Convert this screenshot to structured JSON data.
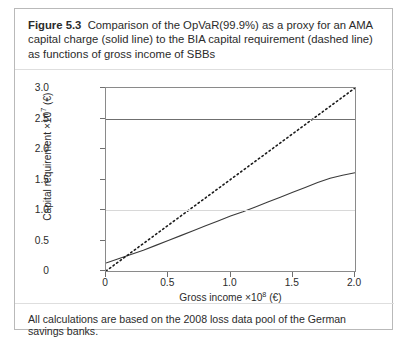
{
  "figure": {
    "caption_label": "Figure 5.3",
    "caption_text": "Comparison of the OpVaR(99.9%) as a proxy for an AMA capital charge (solid line) to the BIA capital requirement (dashed line) as functions of gross income of SBBs",
    "footnote": "All calculations are based on the 2008 loss data pool of the German savings banks."
  },
  "chart_data": {
    "type": "line",
    "title": "",
    "xlabel": "Gross income ×10⁸ (€)",
    "ylabel": "Capital requirement ×10⁷ (€)",
    "xlabel_text": "Gross income",
    "xlabel_mult": "×10",
    "xlabel_exp": "8",
    "xlabel_unit": "(€)",
    "ylabel_text": "Capital requirement",
    "ylabel_mult": "×10",
    "ylabel_exp": "7",
    "ylabel_unit": "(€)",
    "xlim": [
      0,
      2.0
    ],
    "ylim": [
      0,
      3.0
    ],
    "xticks": [
      "0",
      "0.5",
      "1.0",
      "1.5",
      "2.0"
    ],
    "xtick_values": [
      0,
      0.5,
      1.0,
      1.5,
      2.0
    ],
    "yticks": [
      "0",
      "0.5",
      "1.0",
      "1.5",
      "2.0",
      "2.5",
      "3.0"
    ],
    "ytick_values": [
      0,
      0.5,
      1.0,
      1.5,
      2.0,
      2.5,
      3.0
    ],
    "grid": true,
    "gridlines_y": [
      1.0,
      2.5
    ],
    "legend": "none",
    "series": [
      {
        "name": "BIA capital requirement (dashed line)",
        "style": "dashed",
        "color": "#1a1a1a",
        "x": [
          0,
          0.1,
          0.2,
          0.3,
          0.4,
          0.5,
          0.6,
          0.7,
          0.8,
          0.9,
          1.0,
          1.1,
          1.2,
          1.3,
          1.4,
          1.5,
          1.6,
          1.7,
          1.8,
          1.9,
          2.0
        ],
        "values": [
          0.0,
          0.15,
          0.3,
          0.45,
          0.6,
          0.75,
          0.9,
          1.05,
          1.2,
          1.35,
          1.5,
          1.65,
          1.8,
          1.95,
          2.1,
          2.25,
          2.4,
          2.55,
          2.7,
          2.85,
          3.0
        ]
      },
      {
        "name": "OpVaR(99.9%) AMA capital charge (solid line)",
        "style": "solid",
        "color": "#3a3a3a",
        "x": [
          0,
          0.1,
          0.2,
          0.3,
          0.4,
          0.5,
          0.6,
          0.7,
          0.8,
          0.9,
          1.0,
          1.1,
          1.2,
          1.3,
          1.4,
          1.5,
          1.6,
          1.7,
          1.8,
          1.9,
          2.0
        ],
        "values": [
          0.13,
          0.2,
          0.27,
          0.34,
          0.42,
          0.5,
          0.58,
          0.66,
          0.74,
          0.82,
          0.9,
          0.97,
          1.05,
          1.13,
          1.21,
          1.29,
          1.37,
          1.45,
          1.52,
          1.57,
          1.61
        ]
      }
    ]
  }
}
